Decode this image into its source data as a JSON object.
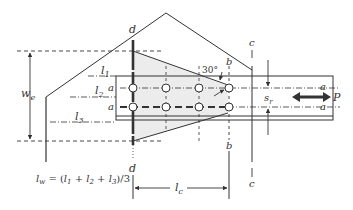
{
  "figure": {
    "type": "gusset plate Whitmore section diagram",
    "labels": {
      "section_d_top": "d",
      "section_d_bottom": "d",
      "section_b_top": "b",
      "section_b_bottom": "b",
      "section_c_top": "c",
      "section_c_bottom": "c",
      "bolt_line_a_left_1": "a",
      "bolt_line_a_left_2": "a",
      "bolt_line_a_right_1": "a",
      "bolt_line_a_right_2": "a",
      "l1": "l",
      "l1_sub": "1",
      "l2": "l",
      "l2_sub": "2",
      "l3": "l",
      "l3_sub": "3",
      "we": "w",
      "we_sub": "e",
      "sr": "s",
      "sr_sub": "r",
      "lc": "l",
      "lc_sub": "c",
      "load": "P",
      "angle": "30°",
      "formula": "l_w = (l_1 + l_2 + l_3)/3",
      "formula_lhs": "l",
      "formula_lhs_sub": "w",
      "formula_rhs_prefix": " = (",
      "formula_t1": "l",
      "formula_t1_sub": "1",
      "formula_plus1": " + ",
      "formula_t2": "l",
      "formula_t2_sub": "2",
      "formula_plus2": " + ",
      "formula_t3": "l",
      "formula_t3_sub": "3",
      "formula_suffix": ")/3"
    },
    "colors": {
      "line": "#333333",
      "shade": "#ececec",
      "background": "#ffffff"
    }
  }
}
